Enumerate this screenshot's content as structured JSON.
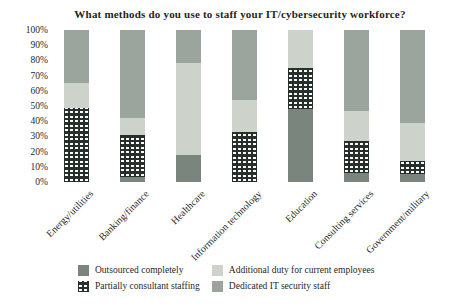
{
  "title": "What methods do you use to staff your IT/cybersecurity workforce?",
  "colors": {
    "text": "#1f1f1f",
    "background": "#ffffff",
    "outsourced": "#7a867d",
    "partial_pattern_base": "#272f2b",
    "additional_duty": "#cdd3cb",
    "dedicated_staff": "#9ca59d"
  },
  "chart_data": {
    "type": "bar",
    "stacked": true,
    "orientation": "vertical",
    "title": "What methods do you use to staff your IT/cybersecurity workforce?",
    "categories": [
      "Energy/utilities",
      "Banking/finance",
      "Healthcare",
      "Information technology",
      "Education",
      "Consulting services",
      "Government/military"
    ],
    "series": [
      {
        "name": "Outsourced completely",
        "color": "#7a867d",
        "pattern": "solid",
        "values": [
          0,
          3,
          18,
          0,
          48,
          6,
          5
        ]
      },
      {
        "name": "Partially consultant staffing",
        "color": "#272f2b",
        "pattern": "white-dots",
        "values": [
          49,
          28,
          0,
          33,
          27,
          21,
          9
        ]
      },
      {
        "name": "Additional duty for current employees",
        "color": "#cdd3cb",
        "pattern": "solid",
        "values": [
          16,
          11,
          60,
          21,
          25,
          20,
          25
        ]
      },
      {
        "name": "Dedicated IT security staff",
        "color": "#9ca59d",
        "pattern": "solid",
        "values": [
          35,
          58,
          22,
          46,
          0,
          53,
          61
        ]
      }
    ],
    "xlabel": "",
    "ylabel": "",
    "ylim": [
      0,
      100
    ],
    "yticks": [
      "0%",
      "10%",
      "20%",
      "30%",
      "40%",
      "50%",
      "60%",
      "70%",
      "80%",
      "90%",
      "100%"
    ],
    "grid": false,
    "legend_position": "bottom",
    "legend_layout": {
      "columns": [
        [
          0,
          1
        ],
        [
          2,
          3
        ]
      ]
    }
  }
}
